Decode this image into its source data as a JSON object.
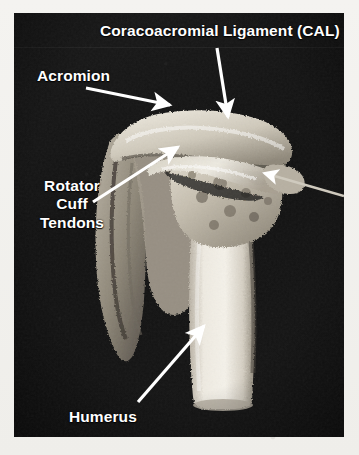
{
  "figure": {
    "kind": "anatomical-photograph",
    "panel_background_color": "#141414",
    "label_color": "#ffffff",
    "margin_color": "#f3f2ef"
  },
  "labels": {
    "cal": "Coracoacromial Ligament (CAL)",
    "acromion": "Acromion",
    "rotator_cuff": "Rotator Cuff Tendons",
    "rotator_cuff_lines": [
      "Rotator",
      "Cuff",
      "Tendons"
    ],
    "humerus": "Humerus"
  },
  "annotations": [
    {
      "name": "cal-leader-arrow",
      "label": "Coracoacromial Ligament (CAL)",
      "from": [
        217,
        48
      ],
      "to": [
        228,
        120
      ],
      "direction": "down"
    },
    {
      "name": "acromion-leader-arrow",
      "label": "Acromion",
      "from": [
        86,
        88
      ],
      "to": [
        174,
        107
      ],
      "direction": "right-down"
    },
    {
      "name": "rotator-cuff-leader-arrow",
      "label": "Rotator Cuff Tendons",
      "from": [
        93,
        202
      ],
      "to": [
        180,
        145
      ],
      "direction": "up-right"
    },
    {
      "name": "humerus-leader-arrow",
      "label": "Humerus",
      "from": [
        138,
        402
      ],
      "to": [
        204,
        324
      ],
      "direction": "up-right"
    },
    {
      "name": "unlabeled-right-leader-arrow",
      "label": "",
      "from": [
        344,
        196
      ],
      "to": [
        262,
        172
      ],
      "direction": "left-up"
    }
  ],
  "structures": [
    {
      "name": "acromion",
      "description": "Bony arch spanning the top of the specimen"
    },
    {
      "name": "coracoacromial-ligament",
      "description": "Pale fibrous band bridging beneath the acromion"
    },
    {
      "name": "humeral-head",
      "description": "Rounded cancellous bone head below the arch"
    },
    {
      "name": "humeral-shaft",
      "description": "Bright vertical cortical shaft descending to the bottom"
    },
    {
      "name": "scapular-spine",
      "description": "Flat blade of bone extending down and to the left"
    }
  ]
}
